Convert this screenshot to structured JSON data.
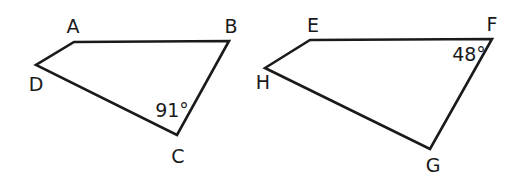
{
  "figure": {
    "quadrilaterals": [
      {
        "name": "ABCD",
        "vertices": [
          {
            "label": "A",
            "x": 74,
            "y": 42,
            "lx": 73,
            "ly": 33
          },
          {
            "label": "B",
            "x": 229,
            "y": 41,
            "lx": 231,
            "ly": 33
          },
          {
            "label": "C",
            "x": 177,
            "y": 135,
            "lx": 178,
            "ly": 163
          },
          {
            "label": "D",
            "x": 36,
            "y": 65,
            "lx": 36,
            "ly": 91
          }
        ],
        "angle": {
          "vertex": "C",
          "text": "91°",
          "x": 172,
          "y": 117
        }
      },
      {
        "name": "EFGH",
        "vertices": [
          {
            "label": "E",
            "x": 310,
            "y": 40,
            "lx": 313,
            "ly": 32
          },
          {
            "label": "F",
            "x": 492,
            "y": 39,
            "lx": 492,
            "ly": 31
          },
          {
            "label": "G",
            "x": 430,
            "y": 149,
            "lx": 433,
            "ly": 172
          },
          {
            "label": "H",
            "x": 265,
            "y": 68,
            "lx": 263,
            "ly": 89
          }
        ],
        "angle": {
          "vertex": "F",
          "text": "48°",
          "x": 469,
          "y": 61
        }
      }
    ]
  },
  "labels": {
    "A": "A",
    "B": "B",
    "C": "C",
    "D": "D",
    "E": "E",
    "F": "F",
    "G": "G",
    "H": "H",
    "angle_C": "91°",
    "angle_F": "48°"
  }
}
